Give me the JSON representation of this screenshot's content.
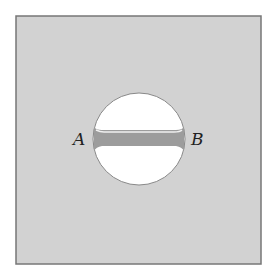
{
  "diagram": {
    "labels": {
      "left": "A",
      "right": "B"
    },
    "colors": {
      "plate": "#d0d0d0",
      "plate_border": "#777777",
      "hole": "#ffffff",
      "bar": "#9a9a9a",
      "bar_highlight": "#e8e8e8"
    }
  }
}
